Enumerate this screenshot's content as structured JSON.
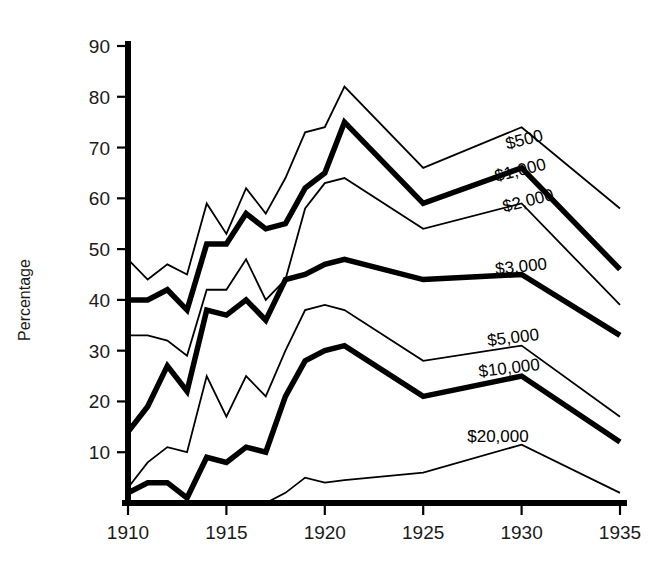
{
  "chart_data": {
    "type": "line",
    "title": "",
    "xlabel": "",
    "ylabel": "Percentage",
    "xlim": [
      1910,
      1935
    ],
    "ylim": [
      0,
      90
    ],
    "grid": false,
    "legend_position": "inline-right",
    "x": [
      1910,
      1911,
      1912,
      1913,
      1914,
      1915,
      1916,
      1917,
      1918,
      1919,
      1920,
      1921,
      1925,
      1930,
      1935
    ],
    "yticks": [
      10,
      20,
      30,
      40,
      50,
      60,
      70,
      80,
      90
    ],
    "ytick_labels": [
      "10",
      "20",
      "30",
      "40",
      "50",
      "60",
      "70",
      "80",
      "90"
    ],
    "xticks": [
      1910,
      1915,
      1920,
      1925,
      1930,
      1935
    ],
    "xtick_labels": [
      "1910",
      "1915",
      "1920",
      "1925",
      "1930",
      "1935"
    ],
    "series": [
      {
        "name": "$500",
        "label": "$500",
        "style": "thin",
        "values": [
          48,
          44,
          47,
          45,
          59,
          53,
          62,
          57,
          64,
          73,
          74,
          82,
          66,
          74,
          58
        ]
      },
      {
        "name": "$1,000",
        "label": "$1,000",
        "style": "bold",
        "values": [
          40,
          40,
          42,
          38,
          51,
          51,
          57,
          54,
          55,
          62,
          65,
          75,
          59,
          66,
          46
        ]
      },
      {
        "name": "$2,000",
        "label": "$2,000",
        "style": "thin",
        "values": [
          33,
          33,
          32,
          29,
          42,
          42,
          48,
          40,
          44,
          58,
          63,
          64,
          54,
          59,
          39
        ]
      },
      {
        "name": "$3,000",
        "label": "$3,000",
        "style": "bold",
        "values": [
          14,
          19,
          27,
          22,
          38,
          37,
          40,
          36,
          44,
          45,
          47,
          48,
          44,
          45,
          33
        ]
      },
      {
        "name": "$5,000",
        "label": "$5,000",
        "style": "thin",
        "values": [
          3,
          8,
          11,
          10,
          25,
          17,
          25,
          21,
          30,
          38,
          39,
          38,
          28,
          31,
          17
        ]
      },
      {
        "name": "$10,000",
        "label": "$10,000",
        "style": "bold",
        "values": [
          2,
          4,
          4,
          1,
          9,
          8,
          11,
          10,
          21,
          28,
          30,
          31,
          21,
          25,
          12
        ]
      },
      {
        "name": "$20,000",
        "label": "$20,000",
        "style": "thin",
        "values": [
          0,
          0,
          0,
          0,
          0,
          0,
          0,
          0,
          2,
          5,
          4,
          4.5,
          6,
          11.5,
          2
        ]
      }
    ],
    "series_label_positions": [
      {
        "label": "$500",
        "x": 1930.2,
        "y": 70.5,
        "rotate": -14
      },
      {
        "label": "$1,000",
        "x": 1930.0,
        "y": 64.5,
        "rotate": -14
      },
      {
        "label": "$2,000",
        "x": 1930.4,
        "y": 58.5,
        "rotate": -14
      },
      {
        "label": "$3,000",
        "x": 1930.0,
        "y": 45.5,
        "rotate": -6
      },
      {
        "label": "$5,000",
        "x": 1929.6,
        "y": 31.5,
        "rotate": -7
      },
      {
        "label": "$10,000",
        "x": 1929.4,
        "y": 25.5,
        "rotate": -7
      },
      {
        "label": "$20,000",
        "x": 1928.8,
        "y": 12.0,
        "rotate": 0
      }
    ]
  },
  "axes": {
    "y_title": "Percentage"
  }
}
